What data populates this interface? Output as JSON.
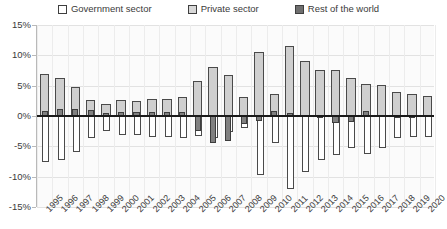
{
  "legend": {
    "items": [
      {
        "label": "Government sector",
        "key": "government",
        "swatch": "white",
        "color": "#ffffff"
      },
      {
        "label": "Private sector",
        "key": "private",
        "swatch": "light-gray",
        "color": "#cfcfcf"
      },
      {
        "label": "Rest of the world",
        "key": "rest_of_world",
        "swatch": "dark-gray",
        "color": "#808080"
      }
    ]
  },
  "axis": {
    "y_ticks": [
      "15%",
      "10%",
      "5%",
      "0%",
      "-5%",
      "-10%",
      "-15%"
    ],
    "y_values": [
      15,
      10,
      5,
      0,
      -5,
      -10,
      -15
    ]
  },
  "chart_data": {
    "type": "bar",
    "title": "",
    "subtitle": "",
    "xlabel": "",
    "ylabel": "",
    "ylim": [
      -15,
      15
    ],
    "ytick_step": 5,
    "grid": true,
    "legend_position": "top",
    "bar_mode": "overlay",
    "categories": [
      "1995",
      "1996",
      "1997",
      "1998",
      "1999",
      "2000",
      "2001",
      "2002",
      "2003",
      "2004",
      "2005",
      "2006",
      "2007",
      "2008",
      "2009",
      "2010",
      "2011",
      "2012",
      "2013",
      "2014",
      "2015",
      "2016",
      "2017",
      "2018",
      "2019",
      "2020"
    ],
    "series": [
      {
        "name": "Government sector",
        "values": [
          -7.5,
          -7.3,
          -6.0,
          -3.6,
          -2.4,
          -3.1,
          -3.1,
          -3.5,
          -3.4,
          -3.7,
          -3.3,
          -3.6,
          -2.6,
          -1.9,
          -9.8,
          -4.4,
          -12.0,
          -9.2,
          -7.2,
          -6.4,
          -5.2,
          -6.2,
          -5.2,
          -3.6,
          -3.5,
          -3.5
        ]
      },
      {
        "name": "Private sector",
        "values": [
          7.0,
          6.2,
          4.8,
          2.6,
          2.0,
          2.6,
          2.4,
          2.8,
          2.8,
          3.1,
          5.8,
          8.0,
          6.8,
          3.2,
          10.6,
          3.6,
          11.5,
          9.0,
          7.6,
          7.6,
          6.2,
          5.3,
          5.1,
          4.0,
          3.7,
          3.3
        ]
      },
      {
        "name": "Rest of the world",
        "values": [
          0.9,
          1.1,
          1.2,
          1.0,
          0.5,
          0.6,
          0.7,
          0.7,
          0.6,
          0.7,
          -2.4,
          -4.4,
          -4.2,
          -1.3,
          -0.8,
          0.8,
          0.5,
          0.2,
          -0.4,
          -1.2,
          -1.0,
          0.9,
          0.1,
          -0.4,
          -0.2,
          0.2
        ]
      }
    ]
  }
}
